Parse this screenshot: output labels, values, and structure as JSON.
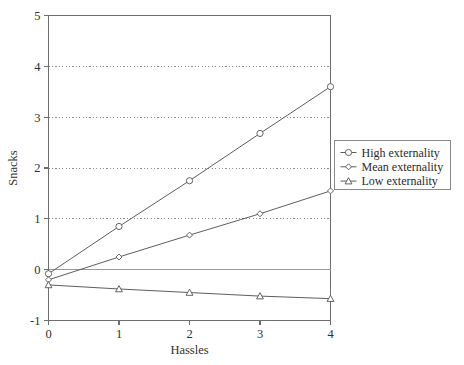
{
  "chart_data": {
    "type": "line",
    "title": "",
    "xlabel": "Hassles",
    "ylabel": "Snacks",
    "x": [
      0,
      1,
      2,
      3,
      4
    ],
    "xticks": [
      "0",
      "1",
      "2",
      "3",
      "4"
    ],
    "yticks": [
      "-1",
      "0",
      "1",
      "2",
      "3",
      "4",
      "5"
    ],
    "xlim": [
      0,
      4
    ],
    "ylim": [
      -1,
      5
    ],
    "grid": "horizontal-dotted",
    "gridlines_at": [
      1,
      2,
      3,
      4
    ],
    "zero_line": 0,
    "legend_position": "right",
    "series": [
      {
        "name": "High externality",
        "marker": "circle",
        "values": [
          -0.08,
          0.85,
          1.75,
          2.68,
          3.6
        ]
      },
      {
        "name": "Mean externality",
        "marker": "diamond",
        "values": [
          -0.2,
          0.25,
          0.68,
          1.1,
          1.55
        ]
      },
      {
        "name": "Low externality",
        "marker": "triangle",
        "values": [
          -0.3,
          -0.38,
          -0.45,
          -0.52,
          -0.57
        ]
      }
    ],
    "colors": {
      "line": "#555555",
      "axis": "#6e6e6e",
      "grid": "#808080",
      "text": "#2b2b2b",
      "background": "#ffffff"
    }
  }
}
